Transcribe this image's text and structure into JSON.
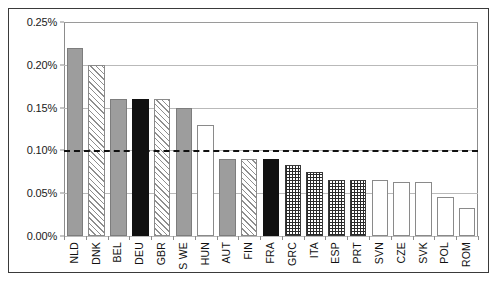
{
  "chart_data": {
    "type": "bar",
    "title": "",
    "xlabel": "",
    "ylabel": "",
    "ylim": [
      0,
      0.25
    ],
    "ytick_labels": [
      "0.00%",
      "0.05%",
      "0.10%",
      "0.15%",
      "0.20%",
      "0.25%"
    ],
    "ytick_values": [
      0,
      0.05,
      0.1,
      0.15,
      0.2,
      0.25
    ],
    "grid": true,
    "legend": "none",
    "value_unit": "%",
    "reference_line": {
      "value": 0.1,
      "style": "dashed",
      "color": "#111111",
      "label": ""
    },
    "categories": [
      "NLD",
      "DNK",
      "BEL",
      "DEU",
      "GBR",
      "S WE",
      "HUN",
      "AUT",
      "FIN",
      "FRA",
      "GRC",
      "ITA",
      "ESP",
      "PRT",
      "SVN",
      "CZE",
      "SVK",
      "POL",
      "ROM"
    ],
    "values": [
      0.22,
      0.2,
      0.16,
      0.16,
      0.16,
      0.15,
      0.13,
      0.09,
      0.09,
      0.09,
      0.083,
      0.075,
      0.065,
      0.065,
      0.065,
      0.063,
      0.063,
      0.045,
      0.033
    ],
    "bar_styles": [
      "gray",
      "hatch",
      "gray",
      "black",
      "hatch",
      "gray",
      "white",
      "gray",
      "hatch",
      "black",
      "dots",
      "dots",
      "dots",
      "dots",
      "white",
      "white",
      "white",
      "white",
      "white"
    ],
    "bars": [
      {
        "label": "NLD",
        "value": 0.22,
        "style": "gray"
      },
      {
        "label": "DNK",
        "value": 0.2,
        "style": "hatch"
      },
      {
        "label": "BEL",
        "value": 0.16,
        "style": "gray"
      },
      {
        "label": "DEU",
        "value": 0.16,
        "style": "black"
      },
      {
        "label": "GBR",
        "value": 0.16,
        "style": "hatch"
      },
      {
        "label": "S WE",
        "value": 0.15,
        "style": "gray"
      },
      {
        "label": "HUN",
        "value": 0.13,
        "style": "white"
      },
      {
        "label": "AUT",
        "value": 0.09,
        "style": "gray"
      },
      {
        "label": "FIN",
        "value": 0.09,
        "style": "hatch"
      },
      {
        "label": "FRA",
        "value": 0.09,
        "style": "black"
      },
      {
        "label": "GRC",
        "value": 0.083,
        "style": "dots"
      },
      {
        "label": "ITA",
        "value": 0.075,
        "style": "dots"
      },
      {
        "label": "ESP",
        "value": 0.065,
        "style": "dots"
      },
      {
        "label": "PRT",
        "value": 0.065,
        "style": "dots"
      },
      {
        "label": "SVN",
        "value": 0.065,
        "style": "white"
      },
      {
        "label": "CZE",
        "value": 0.063,
        "style": "white"
      },
      {
        "label": "SVK",
        "value": 0.063,
        "style": "white"
      },
      {
        "label": "POL",
        "value": 0.045,
        "style": "white"
      },
      {
        "label": "ROM",
        "value": 0.033,
        "style": "white"
      }
    ],
    "colors": {
      "gray": "#9d9d9d",
      "black": "#111111",
      "white": "#ffffff",
      "hatch": "#8e8e8e",
      "dots": "#2a2a2a",
      "grid": "#b9b9b9",
      "axis": "#8c8c8c",
      "border": "#3a3a3a"
    }
  }
}
